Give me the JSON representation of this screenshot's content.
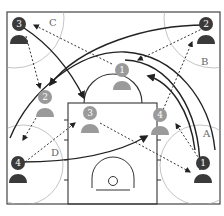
{
  "diagram": {
    "type": "basketball-half-court-play",
    "colors": {
      "court_line": "#333333",
      "zone_circle": "#999999",
      "offense_dark": "#3a3a3a",
      "offense_light": "#9a9a9a",
      "cut_line": "#222222",
      "pass_line": "#333333"
    },
    "zones": [
      {
        "id": "A",
        "label": "A"
      },
      {
        "id": "B",
        "label": "B"
      },
      {
        "id": "C",
        "label": "C"
      },
      {
        "id": "D",
        "label": "D"
      }
    ],
    "players_start": [
      {
        "number": "1",
        "shade": "dark",
        "position": "right corner"
      },
      {
        "number": "2",
        "shade": "dark",
        "position": "top right wing"
      },
      {
        "number": "3",
        "shade": "dark",
        "position": "top left wing"
      },
      {
        "number": "4",
        "shade": "dark",
        "position": "left corner"
      }
    ],
    "players_end": [
      {
        "number": "1",
        "shade": "light",
        "position": "top of key"
      },
      {
        "number": "2",
        "shade": "light",
        "position": "left wing"
      },
      {
        "number": "3",
        "shade": "light",
        "position": "left lane"
      },
      {
        "number": "4",
        "shade": "light",
        "position": "right lane line"
      }
    ],
    "legend": {
      "solid_arrow": "cut / movement",
      "dotted_arrow": "pass"
    }
  }
}
